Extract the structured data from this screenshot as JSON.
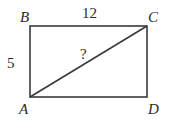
{
  "diagram": {
    "type": "rectangle-with-diagonal",
    "vertices": {
      "A": {
        "label": "A"
      },
      "B": {
        "label": "B"
      },
      "C": {
        "label": "C"
      },
      "D": {
        "label": "D"
      }
    },
    "side_labels": {
      "top": "12",
      "left": "5"
    },
    "diagonal_label": "?",
    "colors": {
      "stroke": "#3a3a3a",
      "text": "#2a2a2a",
      "background": "#ffffff"
    }
  }
}
